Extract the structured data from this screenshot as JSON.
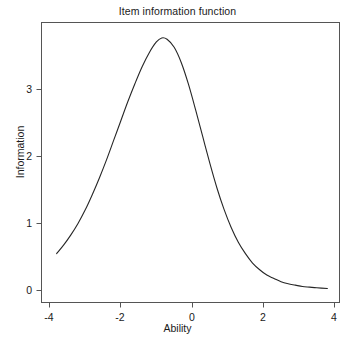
{
  "chart_data": {
    "type": "line",
    "title": "Item information function",
    "xlabel": "Ability",
    "ylabel": "Information",
    "xlim": [
      -3.95,
      3.95
    ],
    "ylim": [
      0.0,
      3.95
    ],
    "xticks": [
      -4,
      -2,
      0,
      2,
      4
    ],
    "xtick_labels": [
      "-4",
      "-2",
      "0",
      "2",
      "4"
    ],
    "yticks": [
      0,
      1,
      2,
      3
    ],
    "ytick_labels": [
      "0",
      "1",
      "2",
      "3"
    ],
    "grid": false,
    "legend": null,
    "line_color": "#262626",
    "line_width": 1.0,
    "series": [
      {
        "name": "Item information",
        "x": [
          -3.8,
          -3.6,
          -3.4,
          -3.2,
          -3.0,
          -2.8,
          -2.6,
          -2.4,
          -2.2,
          -2.0,
          -1.8,
          -1.6,
          -1.4,
          -1.2,
          -1.0,
          -0.85,
          -0.7,
          -0.5,
          -0.3,
          -0.1,
          0.1,
          0.3,
          0.5,
          0.7,
          0.9,
          1.1,
          1.3,
          1.5,
          1.7,
          1.9,
          2.1,
          2.3,
          2.5,
          2.7,
          2.9,
          3.1,
          3.3,
          3.5,
          3.8
        ],
        "y": [
          0.55,
          0.68,
          0.83,
          1.0,
          1.2,
          1.43,
          1.68,
          1.95,
          2.24,
          2.53,
          2.82,
          3.09,
          3.34,
          3.55,
          3.71,
          3.77,
          3.75,
          3.63,
          3.4,
          3.08,
          2.7,
          2.3,
          1.9,
          1.53,
          1.21,
          0.94,
          0.72,
          0.55,
          0.41,
          0.31,
          0.23,
          0.18,
          0.13,
          0.1,
          0.08,
          0.06,
          0.05,
          0.04,
          0.03
        ]
      }
    ],
    "peak": {
      "x": -0.85,
      "y": 3.77
    }
  },
  "axes": {
    "x_tick_values": [
      -4,
      -2,
      0,
      2,
      4
    ],
    "y_tick_values": [
      0,
      1,
      2,
      3
    ]
  }
}
